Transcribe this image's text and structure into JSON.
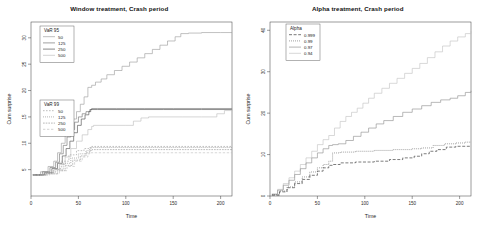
{
  "figure": {
    "background": "#ffffff",
    "panels": [
      {
        "id": "window-treatment",
        "title": "Window treatment, Crash period",
        "xlabel": "Time",
        "ylabel": "Cum surprise",
        "legends": [
          {
            "id": "var95",
            "title": "VaR 95",
            "entries": [
              {
                "label": "50",
                "color": "#9a9a9a",
                "dash": "none"
              },
              {
                "label": "125",
                "color": "#6f6f6f",
                "dash": "none"
              },
              {
                "label": "250",
                "color": "#4a4a4a",
                "dash": "none"
              },
              {
                "label": "500",
                "color": "#bdbdbd",
                "dash": "none"
              }
            ]
          },
          {
            "id": "var99",
            "title": "VaR 99",
            "entries": [
              {
                "label": "50",
                "color": "#9a9a9a",
                "dash": "1.6,1.4"
              },
              {
                "label": "125",
                "color": "#6f6f6f",
                "dash": "0.8,1.2"
              },
              {
                "label": "250",
                "color": "#4a4a4a",
                "dash": "0.6,1.0"
              },
              {
                "label": "500",
                "color": "#bdbdbd",
                "dash": "2.4,1.6"
              }
            ]
          }
        ]
      },
      {
        "id": "alpha-treatment",
        "title": "Alpha treatment, Crash period",
        "xlabel": "Time",
        "ylabel": "Cum surprise",
        "legends": [
          {
            "id": "alpha",
            "title": "Alpha",
            "entries": [
              {
                "label": "0.999",
                "color": "#2e2e2e",
                "dash": "3.0,1.6"
              },
              {
                "label": "0.99",
                "color": "#5a5a5a",
                "dash": "0.9,1.1"
              },
              {
                "label": "0.97",
                "color": "#8e8e8e",
                "dash": "none"
              },
              {
                "label": "0.94",
                "color": "#c2c2c2",
                "dash": "none"
              }
            ]
          }
        ]
      }
    ]
  },
  "chart_data": [
    {
      "type": "line",
      "title": "Window treatment, Crash period",
      "xlabel": "Time",
      "ylabel": "Cum surprise",
      "xlim": [
        0,
        212
      ],
      "ylim": [
        0,
        33
      ],
      "xticks": [
        0,
        50,
        100,
        150,
        200
      ],
      "yticks": [
        5,
        10,
        15,
        20,
        25,
        30
      ],
      "grid": false,
      "legend_position": "top-left",
      "series": [
        {
          "name": "VaR 95 / 50",
          "group": "VaR 95",
          "window": 50,
          "dash": "none",
          "color": "#9a9a9a",
          "x": [
            2,
            10,
            18,
            24,
            28,
            32,
            36,
            40,
            44,
            48,
            52,
            56,
            60,
            64,
            68,
            74,
            80,
            88,
            96,
            104,
            112,
            120,
            128,
            136,
            144,
            152,
            158,
            166,
            180,
            200,
            212
          ],
          "y": [
            4.0,
            4.6,
            5.6,
            6.6,
            8.2,
            10.0,
            11.6,
            13.2,
            14.6,
            16.0,
            17.4,
            18.8,
            20.6,
            21.0,
            21.6,
            22.2,
            23.0,
            23.8,
            24.6,
            25.4,
            26.2,
            27.0,
            27.8,
            28.6,
            29.4,
            30.2,
            30.8,
            30.9,
            31.0,
            31.0,
            31.0
          ]
        },
        {
          "name": "VaR 95 / 125",
          "group": "VaR 95",
          "window": 125,
          "dash": "none",
          "color": "#6f6f6f",
          "x": [
            2,
            12,
            20,
            26,
            30,
            34,
            38,
            42,
            46,
            50,
            54,
            58,
            62,
            64,
            70,
            90,
            120,
            150,
            180,
            212
          ],
          "y": [
            4.0,
            4.6,
            5.4,
            6.4,
            8.0,
            9.6,
            11.2,
            12.6,
            14.0,
            15.0,
            15.6,
            16.0,
            16.4,
            16.6,
            16.6,
            16.6,
            16.6,
            16.6,
            16.6,
            16.6
          ]
        },
        {
          "name": "VaR 95 / 250",
          "group": "VaR 95",
          "window": 250,
          "dash": "none",
          "color": "#4a4a4a",
          "x": [
            2,
            14,
            22,
            28,
            33,
            37,
            41,
            45,
            49,
            53,
            57,
            61,
            63,
            70,
            100,
            140,
            180,
            212
          ],
          "y": [
            4.0,
            4.4,
            5.2,
            6.2,
            7.6,
            9.0,
            10.4,
            12.0,
            13.4,
            14.6,
            15.4,
            16.0,
            16.4,
            16.4,
            16.4,
            16.4,
            16.4,
            16.4
          ]
        },
        {
          "name": "VaR 95 / 500",
          "group": "VaR 95",
          "window": 500,
          "dash": "none",
          "color": "#bdbdbd",
          "x": [
            2,
            16,
            24,
            30,
            36,
            42,
            48,
            54,
            60,
            64,
            66,
            80,
            100,
            108,
            116,
            124,
            140,
            160,
            180,
            196,
            204,
            212
          ],
          "y": [
            4.0,
            4.4,
            5.0,
            6.0,
            7.4,
            9.0,
            10.4,
            11.6,
            12.6,
            13.2,
            13.4,
            13.4,
            13.4,
            14.2,
            14.8,
            15.0,
            15.0,
            15.0,
            15.0,
            15.6,
            16.2,
            16.6
          ]
        },
        {
          "name": "VaR 99 / 50",
          "group": "VaR 99",
          "window": 50,
          "dash": "1.6,1.4",
          "color": "#9a9a9a",
          "x": [
            2,
            14,
            24,
            32,
            40,
            48,
            56,
            62,
            64,
            80,
            110,
            150,
            190,
            212
          ],
          "y": [
            4.0,
            4.4,
            5.2,
            6.6,
            7.8,
            8.6,
            9.0,
            9.2,
            9.4,
            9.4,
            9.4,
            9.4,
            9.4,
            9.4
          ]
        },
        {
          "name": "VaR 99 / 125",
          "group": "VaR 99",
          "window": 125,
          "dash": "0.8,1.2",
          "color": "#6f6f6f",
          "x": [
            2,
            16,
            26,
            34,
            42,
            50,
            58,
            62,
            64,
            90,
            130,
            170,
            212
          ],
          "y": [
            4.0,
            4.4,
            5.0,
            6.2,
            7.2,
            8.0,
            8.6,
            9.0,
            9.2,
            9.2,
            9.2,
            9.2,
            9.2
          ]
        },
        {
          "name": "VaR 99 / 250",
          "group": "VaR 99",
          "window": 250,
          "dash": "0.6,1.0",
          "color": "#4a4a4a",
          "x": [
            2,
            18,
            28,
            36,
            44,
            52,
            58,
            62,
            64,
            100,
            150,
            212
          ],
          "y": [
            4.0,
            4.2,
            4.8,
            5.8,
            6.8,
            7.6,
            8.2,
            8.6,
            8.8,
            8.8,
            8.8,
            8.8
          ]
        },
        {
          "name": "VaR 99 / 500",
          "group": "VaR 99",
          "window": 500,
          "dash": "2.4,1.6",
          "color": "#bdbdbd",
          "x": [
            2,
            20,
            30,
            38,
            46,
            54,
            60,
            62,
            70,
            100,
            140,
            180,
            212
          ],
          "y": [
            4.0,
            4.2,
            4.8,
            5.6,
            6.6,
            7.4,
            8.0,
            8.2,
            8.2,
            8.2,
            8.2,
            8.2,
            8.2
          ]
        }
      ]
    },
    {
      "type": "line",
      "title": "Alpha treatment, Crash period",
      "xlabel": "Time",
      "ylabel": "Cum surprise",
      "xlim": [
        0,
        212
      ],
      "ylim": [
        0,
        42
      ],
      "xticks": [
        0,
        50,
        100,
        150,
        200
      ],
      "yticks": [
        0,
        10,
        20,
        30,
        40
      ],
      "grid": false,
      "legend_position": "top-left",
      "series": [
        {
          "name": "0.94",
          "alpha": 0.94,
          "dash": "none",
          "color": "#c2c2c2",
          "x": [
            2,
            8,
            14,
            20,
            26,
            32,
            38,
            44,
            50,
            56,
            62,
            68,
            74,
            80,
            86,
            92,
            98,
            104,
            110,
            118,
            126,
            134,
            142,
            150,
            158,
            166,
            174,
            182,
            190,
            198,
            206,
            212
          ],
          "y": [
            0.5,
            1.6,
            3.0,
            4.4,
            6.0,
            7.6,
            9.2,
            10.8,
            12.4,
            13.6,
            14.6,
            16.4,
            18.0,
            19.2,
            20.2,
            21.2,
            22.4,
            23.6,
            24.8,
            26.0,
            27.2,
            28.4,
            29.6,
            30.8,
            32.0,
            33.4,
            34.8,
            36.2,
            37.4,
            38.4,
            39.2,
            39.8
          ]
        },
        {
          "name": "0.97",
          "alpha": 0.97,
          "dash": "none",
          "color": "#8e8e8e",
          "x": [
            2,
            8,
            14,
            20,
            26,
            32,
            38,
            44,
            50,
            56,
            62,
            66,
            72,
            80,
            88,
            96,
            104,
            112,
            120,
            130,
            140,
            150,
            160,
            170,
            180,
            190,
            198,
            206,
            212
          ],
          "y": [
            0.4,
            1.4,
            2.6,
            3.8,
            5.2,
            6.6,
            8.0,
            9.2,
            10.4,
            11.4,
            12.2,
            12.4,
            12.6,
            13.4,
            14.4,
            15.4,
            16.4,
            17.4,
            18.2,
            19.2,
            20.2,
            21.0,
            21.8,
            22.6,
            23.2,
            23.6,
            24.2,
            25.0,
            25.4
          ]
        },
        {
          "name": "0.99",
          "alpha": 0.99,
          "dash": "0.9,1.1",
          "color": "#5a5a5a",
          "x": [
            2,
            10,
            18,
            26,
            34,
            42,
            50,
            56,
            62,
            66,
            74,
            90,
            110,
            130,
            150,
            160,
            172,
            184,
            196,
            206,
            212
          ],
          "y": [
            0.3,
            1.2,
            2.2,
            3.4,
            4.6,
            5.8,
            6.8,
            7.6,
            8.4,
            10.4,
            10.6,
            10.8,
            11.0,
            11.2,
            11.4,
            11.6,
            12.2,
            12.6,
            12.8,
            13.0,
            13.0
          ]
        },
        {
          "name": "0.999",
          "alpha": 0.999,
          "dash": "3.0,1.6",
          "color": "#2e2e2e",
          "x": [
            2,
            10,
            18,
            26,
            34,
            42,
            50,
            56,
            62,
            66,
            74,
            90,
            110,
            126,
            140,
            152,
            160,
            168,
            176,
            186,
            196,
            206,
            212
          ],
          "y": [
            0.2,
            1.0,
            2.0,
            3.0,
            4.0,
            5.0,
            6.0,
            6.8,
            7.4,
            7.6,
            8.0,
            8.2,
            8.4,
            8.8,
            9.2,
            9.6,
            10.2,
            10.8,
            11.2,
            11.8,
            12.0,
            12.0,
            12.0
          ]
        }
      ]
    }
  ]
}
